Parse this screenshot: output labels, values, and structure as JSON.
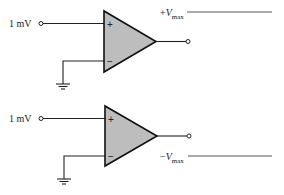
{
  "diagram": {
    "type": "op-amp comparator circuits",
    "circuits": [
      {
        "id": "top",
        "input_label": "1 mV",
        "noninverting_sign": "+",
        "inverting_sign": "−",
        "output_label_prefix": "+",
        "output_label_var": "V",
        "output_label_sub": "max"
      },
      {
        "id": "bottom",
        "input_label": "1 mV",
        "noninverting_sign": "+",
        "inverting_sign": "−",
        "output_label_prefix": "−",
        "output_label_var": "V",
        "output_label_sub": "max"
      }
    ],
    "colors": {
      "amp_fill": "#bdbdbd",
      "line": "#222222",
      "rail_line": "#555555"
    }
  }
}
